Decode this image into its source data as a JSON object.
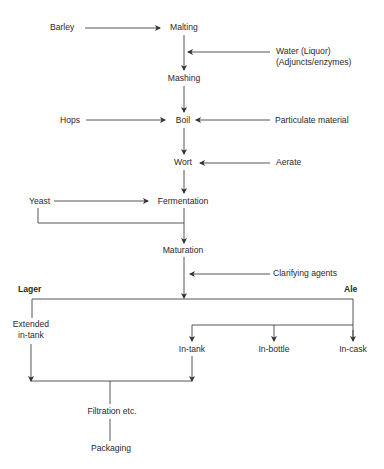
{
  "diagram": {
    "nodes": {
      "barley": "Barley",
      "malting": "Malting",
      "water": "Water (Liquor)",
      "adjuncts": "(Adjuncts/enzymes)",
      "mashing": "Mashing",
      "hops": "Hops",
      "boil": "Boil",
      "particulate": "Particulate material",
      "wort": "Wort",
      "aerate": "Aerate",
      "yeast": "Yeast",
      "fermentation": "Fermentation",
      "maturation": "Maturation",
      "clarifying": "Clarifying agents",
      "lager": "Lager",
      "ale": "Ale",
      "extended_1": "Extended",
      "extended_2": "in-tank",
      "in_tank": "In-tank",
      "in_bottle": "In-bottle",
      "in_cask": "In-cask",
      "filtration": "Filtration etc.",
      "packaging": "Packaging"
    },
    "edges": [
      [
        "Barley",
        "Malting"
      ],
      [
        "Malting",
        "Mashing"
      ],
      [
        "Water (Liquor) (Adjuncts/enzymes)",
        "Malting-Mashing"
      ],
      [
        "Mashing",
        "Boil"
      ],
      [
        "Hops",
        "Boil"
      ],
      [
        "Particulate material",
        "Boil"
      ],
      [
        "Boil",
        "Wort"
      ],
      [
        "Aerate",
        "Wort"
      ],
      [
        "Wort",
        "Fermentation"
      ],
      [
        "Yeast",
        "Fermentation"
      ],
      [
        "Yeast",
        "Maturation"
      ],
      [
        "Fermentation",
        "Maturation"
      ],
      [
        "Clarifying agents",
        "Maturation-split"
      ],
      [
        "Maturation",
        "Lager"
      ],
      [
        "Maturation",
        "Ale"
      ],
      [
        "Lager",
        "Extended in-tank"
      ],
      [
        "Ale",
        "In-tank"
      ],
      [
        "Ale",
        "In-bottle"
      ],
      [
        "Ale",
        "In-cask"
      ],
      [
        "Extended in-tank",
        "Filtration etc."
      ],
      [
        "In-tank",
        "Filtration etc."
      ],
      [
        "Filtration etc.",
        "Packaging"
      ]
    ],
    "line_color": "#333333"
  }
}
